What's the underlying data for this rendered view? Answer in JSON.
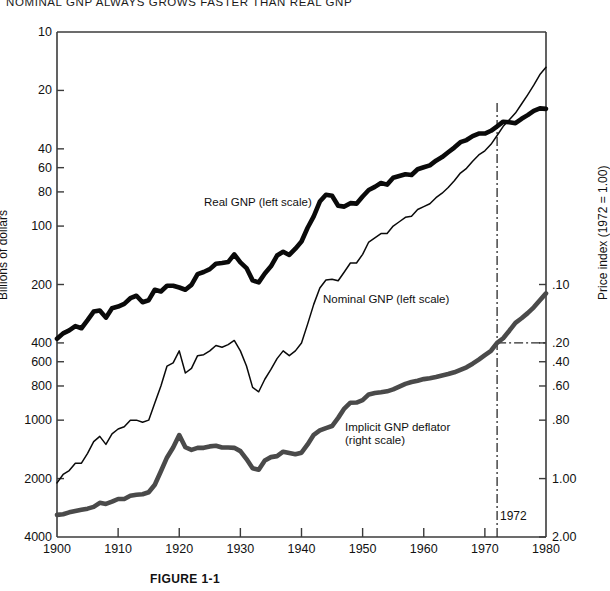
{
  "title": "NOMINAL GNP ALWAYS GROWS FASTER THAN REAL GNP",
  "caption": "FIGURE 1-1",
  "axes": {
    "left_title": "Billions of dollars",
    "right_title": "Price index (1972 = 1.00)",
    "left_ticks": [
      "4000",
      "2000",
      "1000",
      "800",
      "600",
      "400",
      "200",
      "100",
      "80",
      "60",
      "40",
      "20",
      "10"
    ],
    "right_ticks": [
      "2.00",
      "1.00",
      ".80",
      ".60",
      ".40",
      ".20",
      ".10"
    ],
    "x_ticks": [
      "1900",
      "1910",
      "1920",
      "1930",
      "1940",
      "1950",
      "1960",
      "1970",
      "1980"
    ]
  },
  "annotations": {
    "year_marker": "1972",
    "real_label": "Real GNP (left scale)",
    "nominal_label": "Nominal GNP (left scale)",
    "deflator_label_line1": "Implicit GNP deflator",
    "deflator_label_line2": "(right scale)"
  },
  "colors": {
    "real": "#0a0a0a",
    "nominal": "#0a0a0a",
    "deflator": "#4a4a4a",
    "frame": "#3b3b3b"
  },
  "chart_data": {
    "type": "line",
    "title": "NOMINAL GNP ALWAYS GROWS FASTER THAN REAL GNP",
    "xlabel": "",
    "ylabel": "Billions of dollars",
    "y2label": "Price index (1972 = 1.00)",
    "yscale": "log",
    "ylim": [
      10,
      4000
    ],
    "y2lim": [
      0.1,
      4.0
    ],
    "xlim": [
      1900,
      1980
    ],
    "grid": false,
    "legend": "inline-labels",
    "yticks": [
      10,
      20,
      40,
      60,
      80,
      100,
      200,
      400,
      600,
      800,
      1000,
      2000,
      4000
    ],
    "y2ticks": [
      0.1,
      0.2,
      0.4,
      0.6,
      0.8,
      1.0,
      2.0
    ],
    "xticks": [
      1900,
      1910,
      1920,
      1930,
      1940,
      1950,
      1960,
      1970,
      1980
    ],
    "reference_lines": [
      {
        "type": "vertical",
        "x": 1972,
        "style": "dash-dot",
        "label": "1972"
      },
      {
        "type": "horizontal",
        "y2": 1.0,
        "style": "dash-dot",
        "from_x": 1972
      }
    ],
    "series": [
      {
        "name": "Real GNP (left scale)",
        "axis": "left",
        "units": "billions of 1972 dollars",
        "linewidth": "heavy",
        "x": [
          1900,
          1901,
          1902,
          1903,
          1904,
          1905,
          1906,
          1907,
          1908,
          1909,
          1910,
          1911,
          1912,
          1913,
          1914,
          1915,
          1916,
          1917,
          1918,
          1919,
          1920,
          1921,
          1922,
          1923,
          1924,
          1925,
          1926,
          1927,
          1928,
          1929,
          1930,
          1931,
          1932,
          1933,
          1934,
          1935,
          1936,
          1937,
          1938,
          1939,
          1940,
          1941,
          1942,
          1943,
          1944,
          1945,
          1946,
          1947,
          1948,
          1949,
          1950,
          1951,
          1952,
          1953,
          1954,
          1955,
          1956,
          1957,
          1958,
          1959,
          1960,
          1961,
          1962,
          1963,
          1964,
          1965,
          1966,
          1967,
          1968,
          1969,
          1970,
          1971,
          1972,
          1973,
          1974,
          1975,
          1976,
          1977,
          1978,
          1979,
          1980
        ],
        "values": [
          105,
          112,
          116,
          122,
          119,
          131,
          145,
          147,
          135,
          151,
          154,
          159,
          170,
          175,
          162,
          166,
          188,
          184,
          197,
          197,
          193,
          188,
          199,
          226,
          232,
          240,
          256,
          258,
          261,
          286,
          260,
          243,
          210,
          205,
          228,
          248,
          282,
          295,
          284,
          306,
          333,
          392,
          449,
          535,
          580,
          573,
          509,
          504,
          525,
          522,
          568,
          614,
          637,
          667,
          654,
          710,
          725,
          740,
          733,
          785,
          804,
          822,
          869,
          907,
          960,
          1015,
          1082,
          1110,
          1163,
          1199,
          1199,
          1239,
          1306,
          1380,
          1371,
          1356,
          1428,
          1492,
          1571,
          1617,
          1607
        ]
      },
      {
        "name": "Nominal GNP (left scale)",
        "axis": "left",
        "units": "billions of current dollars",
        "linewidth": "thin",
        "x": [
          1900,
          1901,
          1902,
          1903,
          1904,
          1905,
          1906,
          1907,
          1908,
          1909,
          1910,
          1911,
          1912,
          1913,
          1914,
          1915,
          1916,
          1917,
          1918,
          1919,
          1920,
          1921,
          1922,
          1923,
          1924,
          1925,
          1926,
          1927,
          1928,
          1929,
          1930,
          1931,
          1932,
          1933,
          1934,
          1935,
          1936,
          1937,
          1938,
          1939,
          1940,
          1941,
          1942,
          1943,
          1944,
          1945,
          1946,
          1947,
          1948,
          1949,
          1950,
          1951,
          1952,
          1953,
          1954,
          1955,
          1956,
          1957,
          1958,
          1959,
          1960,
          1961,
          1962,
          1963,
          1964,
          1965,
          1966,
          1967,
          1968,
          1969,
          1970,
          1971,
          1972,
          1973,
          1974,
          1975,
          1976,
          1977,
          1978,
          1979,
          1980
        ],
        "values": [
          19,
          21,
          22,
          24,
          24,
          27,
          31,
          33,
          30,
          34,
          36,
          37,
          40,
          40,
          39,
          40,
          49,
          60,
          76,
          79,
          91,
          70,
          74,
          86,
          87,
          91,
          97,
          95,
          98,
          103,
          91,
          76,
          59,
          56,
          65,
          73,
          83,
          91,
          86,
          91,
          100,
          125,
          158,
          192,
          211,
          213,
          209,
          232,
          258,
          258,
          286,
          331,
          348,
          366,
          366,
          400,
          421,
          444,
          450,
          487,
          504,
          521,
          560,
          591,
          632,
          685,
          750,
          794,
          864,
          930,
          977,
          1055,
          1171,
          1306,
          1413,
          1528,
          1702,
          1899,
          2128,
          2414,
          2630
        ]
      },
      {
        "name": "Implicit GNP deflator (right scale)",
        "axis": "right",
        "units": "index, 1972 = 1.00",
        "linewidth": "heavy-gray",
        "x": [
          1900,
          1901,
          1902,
          1903,
          1904,
          1905,
          1906,
          1907,
          1908,
          1909,
          1910,
          1911,
          1912,
          1913,
          1914,
          1915,
          1916,
          1917,
          1918,
          1919,
          1920,
          1921,
          1922,
          1923,
          1924,
          1925,
          1926,
          1927,
          1928,
          1929,
          1930,
          1931,
          1932,
          1933,
          1934,
          1935,
          1936,
          1937,
          1938,
          1939,
          1940,
          1941,
          1942,
          1943,
          1944,
          1945,
          1946,
          1947,
          1948,
          1949,
          1950,
          1951,
          1952,
          1953,
          1954,
          1955,
          1956,
          1957,
          1958,
          1959,
          1960,
          1961,
          1962,
          1963,
          1964,
          1965,
          1966,
          1967,
          1968,
          1969,
          1970,
          1971,
          1972,
          1973,
          1974,
          1975,
          1976,
          1977,
          1978,
          1979,
          1980
        ],
        "values": [
          0.13,
          0.131,
          0.134,
          0.136,
          0.138,
          0.14,
          0.143,
          0.15,
          0.148,
          0.152,
          0.157,
          0.157,
          0.163,
          0.165,
          0.166,
          0.17,
          0.186,
          0.218,
          0.257,
          0.289,
          0.335,
          0.29,
          0.281,
          0.288,
          0.288,
          0.293,
          0.295,
          0.289,
          0.289,
          0.288,
          0.277,
          0.252,
          0.226,
          0.222,
          0.248,
          0.258,
          0.261,
          0.275,
          0.271,
          0.267,
          0.272,
          0.3,
          0.336,
          0.354,
          0.364,
          0.373,
          0.411,
          0.459,
          0.492,
          0.493,
          0.507,
          0.543,
          0.552,
          0.557,
          0.563,
          0.576,
          0.595,
          0.615,
          0.629,
          0.639,
          0.651,
          0.658,
          0.668,
          0.68,
          0.691,
          0.706,
          0.727,
          0.749,
          0.782,
          0.821,
          0.866,
          0.911,
          1.0,
          1.057,
          1.156,
          1.27,
          1.34,
          1.424,
          1.525,
          1.658,
          1.8
        ]
      }
    ]
  }
}
